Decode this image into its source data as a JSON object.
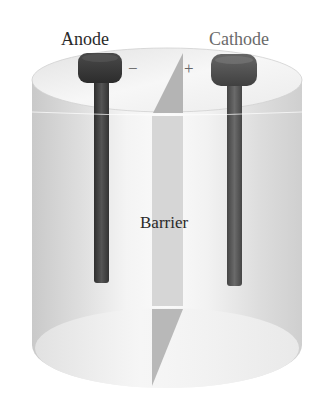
{
  "diagram": {
    "type": "electrochemical-cell",
    "labels": {
      "anode": "Anode",
      "cathode": "Cathode",
      "barrier": "Barrier"
    },
    "signs": {
      "anode": "−",
      "cathode": "+"
    },
    "colors": {
      "anode_electrode": "#3e3e3e",
      "cathode_electrode": "#555555",
      "barrier": "#b8b8b8",
      "container": "#e6e6e6"
    }
  }
}
